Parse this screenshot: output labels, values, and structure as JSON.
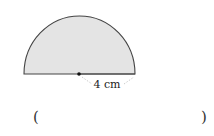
{
  "figure": {
    "shape": "semicircle",
    "fill_color": "#e4e4e4",
    "stroke_color": "#444444",
    "radius_label": "4 cm",
    "center_marker": "dot"
  },
  "answer": {
    "open_paren": "(",
    "close_paren": ")",
    "value": ""
  }
}
